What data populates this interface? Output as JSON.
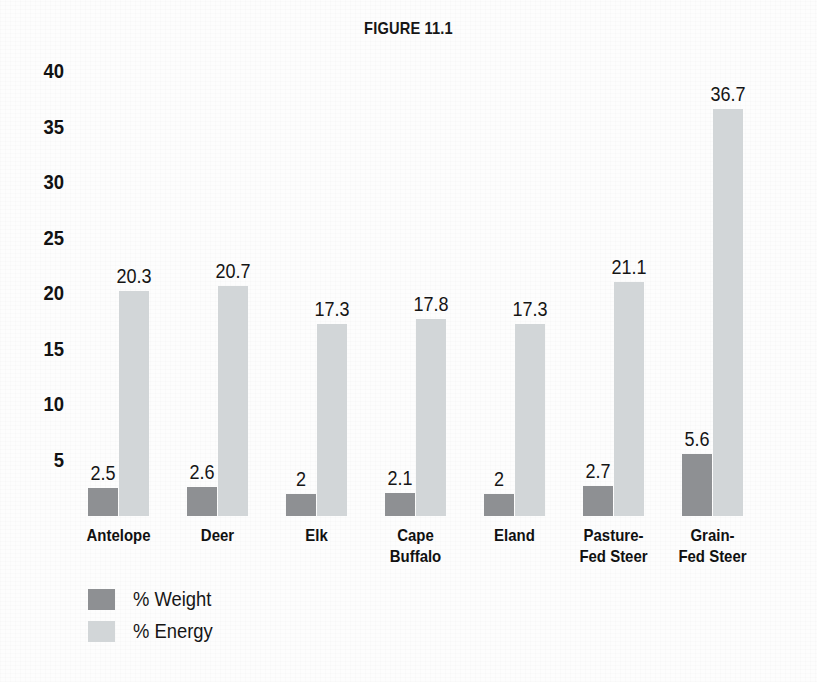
{
  "figure": {
    "title": "FIGURE 11.1"
  },
  "legend": {
    "position": "bottom-left",
    "items": [
      {
        "label": "% Weight",
        "color": "#8e9093"
      },
      {
        "label": "% Energy",
        "color": "#d2d6d8"
      }
    ]
  },
  "axis": {
    "y_ticks": [
      "40",
      "35",
      "30",
      "25",
      "20",
      "15",
      "10",
      "5"
    ]
  },
  "chart_data": {
    "type": "bar",
    "title": "FIGURE 11.1",
    "xlabel": "",
    "ylabel": "",
    "ylim": [
      0,
      40
    ],
    "yticks": [
      5,
      10,
      15,
      20,
      25,
      30,
      35,
      40
    ],
    "grid": false,
    "legend_position": "bottom-left",
    "categories": [
      "Antelope",
      "Deer",
      "Elk",
      "Cape\nBuffalo",
      "Eland",
      "Pasture-\nFed Steer",
      "Grain-\nFed Steer"
    ],
    "series": [
      {
        "name": "% Weight",
        "color": "#8e9093",
        "values": [
          2.5,
          2.6,
          2,
          2.1,
          2,
          2.7,
          5.6
        ],
        "labels": [
          "2.5",
          "2.6",
          "2",
          "2.1",
          "2",
          "2.7",
          "5.6"
        ]
      },
      {
        "name": "% Energy",
        "color": "#d2d6d8",
        "values": [
          20.3,
          20.7,
          17.3,
          17.8,
          17.3,
          21.1,
          36.7
        ],
        "labels": [
          "20.3",
          "20.7",
          "17.3",
          "17.8",
          "17.3",
          "21.1",
          "36.7"
        ]
      }
    ]
  }
}
